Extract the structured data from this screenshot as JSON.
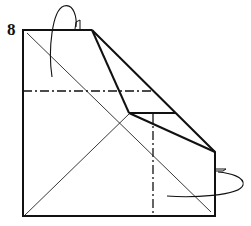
{
  "diagram": {
    "step_number": "8",
    "type": "origami-fold-step",
    "colors": {
      "line": "#111111",
      "background": "#ffffff"
    },
    "elements": {
      "paper_outline": "square paper with upper-right portion folded diagonally",
      "valley_fold_lines": [
        "horizontal dash-dot line across upper-middle",
        "vertical dash-dot line in lower-right"
      ],
      "crease_lines": [
        "diagonal from top-left to bottom-right",
        "diagonal from bottom-left to center vertex"
      ],
      "arrows": [
        "fold-behind arrow at top",
        "fold-behind arrow at right"
      ]
    }
  }
}
